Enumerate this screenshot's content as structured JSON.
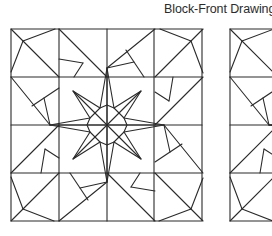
{
  "header": {
    "title": "Block-Front Drawings"
  },
  "figure": {
    "line_color": "#2a2a2a",
    "background": "#ffffff",
    "blocks": [
      {
        "name": "block-1",
        "origin": [
          11,
          29
        ],
        "size": 191,
        "grid": 4,
        "center_motif": "8-pointed star"
      },
      {
        "name": "block-2",
        "origin": [
          230,
          29
        ],
        "size": 191,
        "grid": 4,
        "partially_visible": true
      }
    ]
  }
}
